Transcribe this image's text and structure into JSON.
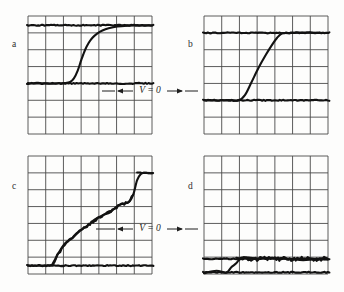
{
  "figure": {
    "background_color": "#fdfdfc",
    "grid_color": "#4a4a4a",
    "trace_color": "#121212",
    "width": 344,
    "height": 292
  },
  "annotations": [
    {
      "id": "vzero-top",
      "text": "V = 0",
      "x": 150,
      "y": 86,
      "arrow_left": true,
      "arrow_right": true
    },
    {
      "id": "vzero-bottom",
      "text": "V = 0",
      "x": 150,
      "y": 224,
      "arrow_left": true,
      "arrow_right": true
    }
  ],
  "panels": [
    {
      "id": "a",
      "label": "a",
      "label_x": 12,
      "label_y": 40,
      "grid": {
        "x": 28,
        "y": 16,
        "width": 124,
        "height": 118,
        "cols": 7,
        "rows": 7
      },
      "baseline_row": 4,
      "top_row": 0.55
    },
    {
      "id": "b",
      "label": "b",
      "label_x": 188,
      "label_y": 40,
      "grid": {
        "x": 204,
        "y": 16,
        "width": 124,
        "height": 118,
        "cols": 7,
        "rows": 7
      },
      "baseline_row": 5,
      "top_row": 1
    },
    {
      "id": "c",
      "label": "c",
      "label_x": 12,
      "label_y": 182,
      "grid": {
        "x": 28,
        "y": 156,
        "width": 124,
        "height": 118,
        "cols": 7,
        "rows": 7
      },
      "baseline_row": 6.5,
      "top_row": 1
    },
    {
      "id": "d",
      "label": "d",
      "label_x": 188,
      "label_y": 182,
      "grid": {
        "x": 204,
        "y": 156,
        "width": 124,
        "height": 118,
        "cols": 7,
        "rows": 7
      },
      "baseline_row": 6.9,
      "top_row": 5.9
    }
  ],
  "chart_data": {
    "type": "line",
    "title": "",
    "xlabel": "",
    "ylabel": "",
    "series": [
      {
        "name": "a",
        "panel": "a",
        "trace_kind": "sigmoidal-fast-rise",
        "xlim": [
          0,
          1
        ],
        "ylim": [
          0,
          1
        ],
        "x": [
          0.0,
          0.06,
          0.12,
          0.18,
          0.24,
          0.3,
          0.34,
          0.37,
          0.4,
          0.43,
          0.46,
          0.49,
          0.52,
          0.56,
          0.6,
          0.65,
          0.72,
          0.8,
          0.88,
          1.0
        ],
        "y": [
          0.0,
          0.0,
          0.0,
          0.0,
          0.0,
          0.01,
          0.03,
          0.09,
          0.22,
          0.41,
          0.58,
          0.7,
          0.79,
          0.86,
          0.91,
          0.95,
          0.98,
          1.0,
          1.0,
          1.0
        ],
        "flat_top_overlay": 1.0,
        "flat_baseline_overlay": 0.0
      },
      {
        "name": "b",
        "panel": "b",
        "trace_kind": "linear-ramp-rise",
        "xlim": [
          0,
          1
        ],
        "ylim": [
          0,
          1
        ],
        "x": [
          0.0,
          0.1,
          0.2,
          0.28,
          0.33,
          0.38,
          0.44,
          0.5,
          0.55,
          0.59,
          0.63,
          0.68,
          0.75,
          0.85,
          1.0
        ],
        "y": [
          0.0,
          0.0,
          0.0,
          0.0,
          0.08,
          0.26,
          0.48,
          0.68,
          0.83,
          0.93,
          0.99,
          1.0,
          1.0,
          1.0,
          1.0
        ],
        "flat_top_overlay": 1.0,
        "flat_baseline_overlay": 0.0
      },
      {
        "name": "c",
        "panel": "c",
        "trace_kind": "stepped-gradual-then-jump",
        "xlim": [
          0,
          1
        ],
        "ylim": [
          0,
          1
        ],
        "x": [
          0.0,
          0.12,
          0.2,
          0.24,
          0.3,
          0.36,
          0.42,
          0.48,
          0.54,
          0.6,
          0.66,
          0.7,
          0.74,
          0.78,
          0.82,
          0.85,
          0.88,
          0.91,
          0.94,
          1.0
        ],
        "y": [
          0.0,
          0.0,
          0.02,
          0.12,
          0.23,
          0.31,
          0.38,
          0.43,
          0.49,
          0.53,
          0.58,
          0.62,
          0.65,
          0.67,
          0.7,
          0.78,
          0.92,
          1.0,
          1.0,
          1.0
        ],
        "flat_top_overlay": 1.0,
        "flat_baseline_overlay": 0.0
      },
      {
        "name": "d",
        "panel": "d",
        "trace_kind": "small-noisy-step",
        "xlim": [
          0,
          1
        ],
        "ylim": [
          0,
          1
        ],
        "x": [
          0.0,
          0.1,
          0.18,
          0.22,
          0.26,
          0.3,
          0.36,
          0.44,
          0.52,
          0.6,
          0.7,
          0.8,
          0.9,
          1.0
        ],
        "y": [
          0.0,
          0.0,
          0.02,
          0.3,
          0.62,
          0.78,
          0.8,
          0.79,
          0.8,
          0.8,
          0.79,
          0.81,
          0.8,
          0.81
        ],
        "flat_top_overlay": 0.8,
        "flat_baseline_overlay": 0.0
      }
    ],
    "legend_position": "none",
    "grid": true
  }
}
